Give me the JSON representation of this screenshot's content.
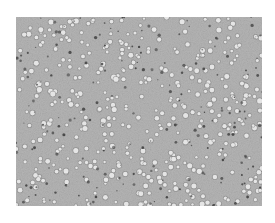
{
  "figure": {
    "type": "brightfield-micrograph",
    "caption": "",
    "colors": {
      "background": "#ffffff",
      "field": "#b5b5b5",
      "cell_bright": "#eeeeee",
      "cell_ring": "#7a7a7a",
      "cell_dark": "#3c3c3c"
    },
    "field_region": {
      "x": 16,
      "y": 17,
      "width": 246,
      "height": 189
    },
    "cells": {
      "bright_count": 420,
      "dark_count": 190,
      "seed": 1337,
      "radius_min": 1.2,
      "radius_max": 2.6
    }
  }
}
